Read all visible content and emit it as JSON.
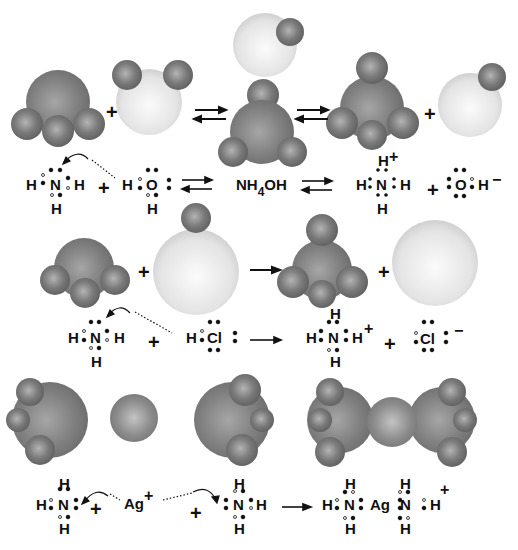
{
  "diagram": {
    "colors": {
      "nitrogen_dark": "#7d7d7d",
      "hydrogen_dark": "#6f6f6f",
      "light_atom": "#e6e6e6",
      "background": "#ffffff",
      "ink": "#111111"
    },
    "rows": [
      {
        "id": "row1",
        "name": "ammonia + water",
        "molecule_models": [
          "NH3",
          "H2O",
          "NH4OH",
          "NH4+",
          "OH-"
        ],
        "equation": {
          "reactant1": "NH3",
          "plus1": "+",
          "reactant2": "H2O",
          "arrow": "equilibrium",
          "middle": {
            "main": "NH",
            "sub": "4",
            "tail": "OH"
          },
          "arrow2": "equilibrium",
          "product1": {
            "center": "N",
            "charge": "+"
          },
          "plus2": "+",
          "product2": {
            "center": "O",
            "right": "H",
            "charge": "−"
          }
        }
      },
      {
        "id": "row2",
        "name": "ammonia + hydrogen chloride",
        "molecule_models": [
          "NH3",
          "HCl",
          "NH4+",
          "Cl-"
        ],
        "equation": {
          "reactant1": "NH3",
          "plus1": "+",
          "reactant2": {
            "left": "H",
            "center": "Cl"
          },
          "arrow": "forward",
          "product1": {
            "center": "N",
            "charge": "+"
          },
          "plus2": "+",
          "product2": {
            "center": "Cl",
            "charge": "−"
          }
        }
      },
      {
        "id": "row3",
        "name": "ammonia + silver ion",
        "molecule_models": [
          "NH3",
          "Ag+",
          "NH3",
          "[Ag(NH3)2]+"
        ],
        "equation": {
          "reactant1": "NH3",
          "plus1": "+",
          "metal": {
            "symbol": "Ag",
            "charge": "+"
          },
          "plus2": "+",
          "reactant3": "NH3",
          "arrow": "forward",
          "product": {
            "left_N": "N",
            "metal": "Ag",
            "right_N": "N",
            "charge": "+"
          }
        }
      }
    ],
    "glyphs": {
      "H": "H",
      "N": "N",
      "O": "O",
      "Cl": "Cl",
      "Ag": "Ag",
      "plus": "+",
      "minus": "−"
    }
  }
}
